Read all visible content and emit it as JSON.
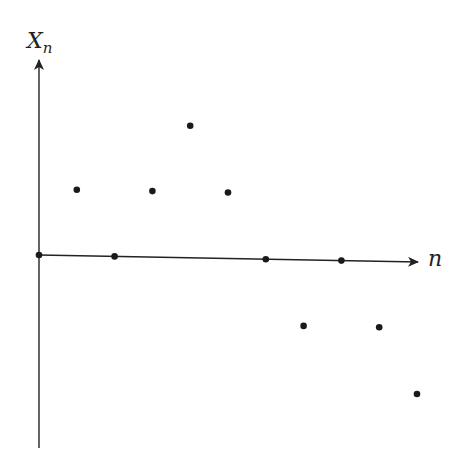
{
  "chart_data": {
    "type": "scatter",
    "title": "",
    "xlabel": "n",
    "ylabel": "X_n",
    "ylabel_main": "X",
    "ylabel_sub": "n",
    "grid": false,
    "legend": null,
    "x": [
      0,
      1,
      2,
      3,
      4,
      5,
      6,
      7,
      8,
      9,
      10
    ],
    "values": [
      0,
      1,
      0,
      1,
      2,
      1,
      0,
      -1,
      0,
      -1,
      -2
    ],
    "xlim": [
      0,
      10.3
    ],
    "ylim": [
      -2.9,
      3.0
    ],
    "colors": {
      "axis": "#222222",
      "point": "#1a1a1a"
    }
  }
}
